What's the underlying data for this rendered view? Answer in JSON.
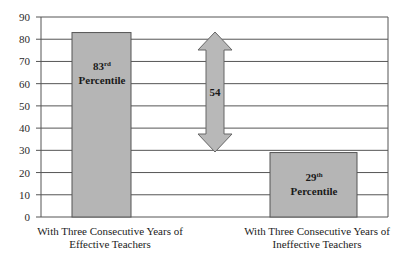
{
  "chart_data": {
    "type": "bar",
    "title": "",
    "xlabel": "",
    "ylabel": "",
    "ylim": [
      0,
      90
    ],
    "yticks": [
      0,
      10,
      20,
      30,
      40,
      50,
      60,
      70,
      80,
      90
    ],
    "grid": true,
    "legend": null,
    "categories": [
      "With Three Consecutive Years of Effective Teachers",
      "With Three Consecutive Years of Ineffective Teachers"
    ],
    "values": [
      83,
      29
    ],
    "bar_labels": [
      {
        "number": "83",
        "suffix": "rd",
        "word": "Percentile"
      },
      {
        "number": "29",
        "suffix": "th",
        "word": "Percentile"
      }
    ],
    "annotations": [
      {
        "type": "double-arrow",
        "from": 29,
        "to": 83,
        "label": "54"
      }
    ],
    "colors": {
      "bar": "#b5b5b5",
      "bar_border": "#555555",
      "grid": "#555555",
      "arrow": "#b8b8b8"
    }
  },
  "labels": {
    "yticks": [
      "0",
      "10",
      "20",
      "30",
      "40",
      "50",
      "60",
      "70",
      "80",
      "90"
    ],
    "cat1_line1": "With Three Consecutive Years of",
    "cat1_line2": "Effective Teachers",
    "cat2_line1": "With Three Consecutive Years of",
    "cat2_line2": "Ineffective Teachers",
    "bar1_number": "83",
    "bar1_suffix": "rd",
    "bar1_word": "Percentile",
    "bar2_number": "29",
    "bar2_suffix": "th",
    "bar2_word": "Percentile",
    "difference": "54"
  }
}
